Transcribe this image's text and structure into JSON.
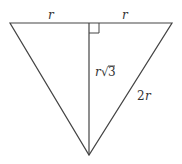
{
  "diagram": {
    "type": "geometry",
    "colors": {
      "stroke": "#444444",
      "text": "#333333",
      "background": "#ffffff"
    },
    "vertices": {
      "top_left": [
        10,
        23
      ],
      "top_right": [
        172,
        23
      ],
      "bottom": [
        89,
        155
      ],
      "altitude_foot": [
        89,
        23
      ]
    },
    "labels": {
      "top_left_segment": "r",
      "top_right_segment": "r",
      "altitude_r": "r",
      "altitude_sqrt": "√",
      "altitude_3": "3",
      "hypotenuse_2": "2",
      "hypotenuse_r": "r"
    },
    "right_angle_marker": true
  }
}
